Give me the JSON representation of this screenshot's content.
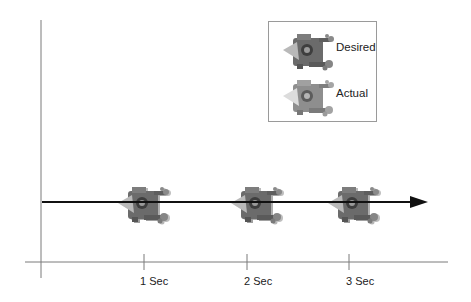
{
  "diagram": {
    "type": "timeline",
    "axis": {
      "ticks": [
        {
          "label": "1 Sec",
          "x": 144
        },
        {
          "label": "2 Sec",
          "x": 247
        },
        {
          "label": "3 Sec",
          "x": 349
        }
      ]
    },
    "legend": {
      "items": [
        {
          "label": "Desired",
          "style": "darker robot figure"
        },
        {
          "label": "Actual",
          "style": "lighter robot figure with highlighted cone"
        }
      ]
    },
    "robots": [
      {
        "time": "1 Sec",
        "x": 118
      },
      {
        "time": "2 Sec",
        "x": 231
      },
      {
        "time": "3 Sec",
        "x": 328
      }
    ],
    "colors": {
      "axis": "#7a7a7a",
      "arrow": "#111111",
      "robot_body": "#6b6b6b",
      "robot_dark": "#3e3e3e",
      "robot_light": "#a8a8a8",
      "robot_cone": "#c9c9c9"
    }
  }
}
